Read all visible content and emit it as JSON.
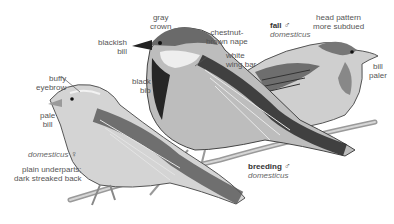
{
  "figure": {
    "labels": {
      "gray_crown": [
        "gray",
        "crown"
      ],
      "blackish_bill": [
        "blackish",
        "bill"
      ],
      "chestnut_nape": [
        "chestnut-",
        "brown nape"
      ],
      "white_wing_bar": [
        "white",
        "wing bar"
      ],
      "black_bib": [
        "black",
        "bib"
      ],
      "buffy_eyebrow": [
        "buffy",
        "eyebrow"
      ],
      "pale_bill": [
        "pale",
        "bill"
      ],
      "head_pattern": [
        "head pattern",
        "more subdued"
      ],
      "bill_paler": [
        "bill",
        "paler"
      ],
      "plain_underparts": [
        "plain underparts;",
        "dark streaked back"
      ]
    },
    "captions": {
      "fall_male": {
        "title": "fall",
        "symbol": "♂",
        "subspecies": "domesticus"
      },
      "breeding_male": {
        "title": "breeding",
        "symbol": "♂",
        "subspecies": "domesticus"
      },
      "female": {
        "subspecies": "domesticus",
        "symbol": "♀"
      }
    }
  }
}
